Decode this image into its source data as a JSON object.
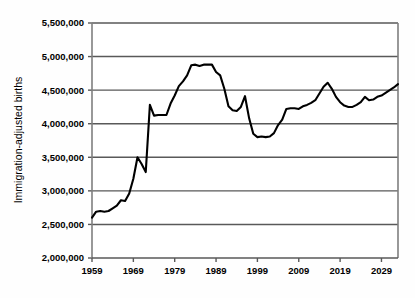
{
  "chart_data": {
    "type": "line",
    "title": "",
    "subtitle": "",
    "xlabel": "",
    "ylabel": "Immigration-adjusted births",
    "xlim": [
      1959,
      2033
    ],
    "ylim": [
      2000000,
      5500000
    ],
    "grid": true,
    "grid_axis": "y",
    "legend": false,
    "legend_position": "none",
    "line_color": "#000000",
    "grid_color": "#595959",
    "axis_color": "#808080",
    "background_color": "#ffffff",
    "ytick_labels": [
      "2,000,000",
      "2,500,000",
      "3,000,000",
      "3,500,000",
      "4,000,000",
      "4,500,000",
      "5,000,000",
      "5,500,000"
    ],
    "ytick_values": [
      2000000,
      2500000,
      3000000,
      3500000,
      4000000,
      4500000,
      5000000,
      5500000
    ],
    "xtick_labels": [
      "1959",
      "1969",
      "1979",
      "1989",
      "1999",
      "2009",
      "2019",
      "2029"
    ],
    "xtick_values": [
      1959,
      1969,
      1979,
      1989,
      1999,
      2009,
      2019,
      2029
    ],
    "series": [
      {
        "name": "Immigration-adjusted births",
        "x": [
          1959,
          1960,
          1961,
          1962,
          1963,
          1964,
          1965,
          1966,
          1967,
          1968,
          1969,
          1970,
          1971,
          1972,
          1973,
          1974,
          1975,
          1976,
          1977,
          1978,
          1979,
          1980,
          1981,
          1982,
          1983,
          1984,
          1985,
          1986,
          1987,
          1988,
          1989,
          1990,
          1991,
          1992,
          1993,
          1994,
          1995,
          1996,
          1997,
          1998,
          1999,
          2000,
          2001,
          2002,
          2003,
          2004,
          2005,
          2006,
          2007,
          2008,
          2009,
          2010,
          2011,
          2012,
          2013,
          2014,
          2015,
          2016,
          2017,
          2018,
          2019,
          2020,
          2021,
          2022,
          2023,
          2024,
          2025,
          2026,
          2027,
          2028,
          2029,
          2030,
          2031,
          2032,
          2033
        ],
        "values": [
          2600000,
          2690000,
          2700000,
          2690000,
          2700000,
          2740000,
          2780000,
          2860000,
          2850000,
          2960000,
          3180000,
          3500000,
          3400000,
          3280000,
          4280000,
          4120000,
          4130000,
          4130000,
          4130000,
          4300000,
          4420000,
          4560000,
          4630000,
          4720000,
          4870000,
          4880000,
          4860000,
          4880000,
          4880000,
          4880000,
          4770000,
          4720000,
          4520000,
          4260000,
          4200000,
          4190000,
          4250000,
          4410000,
          4080000,
          3850000,
          3800000,
          3810000,
          3800000,
          3810000,
          3860000,
          3980000,
          4060000,
          4220000,
          4230000,
          4230000,
          4220000,
          4260000,
          4280000,
          4310000,
          4350000,
          4450000,
          4550000,
          4610000,
          4520000,
          4400000,
          4320000,
          4270000,
          4250000,
          4250000,
          4280000,
          4320000,
          4400000,
          4350000,
          4360000,
          4400000,
          4420000,
          4460000,
          4500000,
          4540000,
          4590000
        ]
      }
    ],
    "annotations": []
  },
  "axis": {
    "y_title": "Immigration-adjusted births"
  }
}
